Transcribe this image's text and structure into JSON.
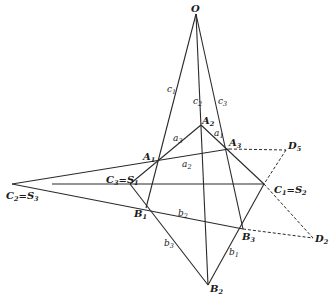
{
  "title": "",
  "points": {
    "O": {
      "label": "O",
      "sub": "",
      "x": 196,
      "y": 14
    },
    "A1": {
      "label": "A",
      "sub": "1",
      "x": 157,
      "y": 157
    },
    "A2": {
      "label": "A",
      "sub": "2",
      "x": 201,
      "y": 125
    },
    "A3": {
      "label": "A",
      "sub": "3",
      "x": 229,
      "y": 149
    },
    "B1": {
      "label": "B",
      "sub": "1",
      "x": 146,
      "y": 208
    },
    "B2": {
      "label": "B",
      "sub": "2",
      "x": 208,
      "y": 285
    },
    "B3": {
      "label": "B",
      "sub": "3",
      "x": 243,
      "y": 229
    },
    "C1S2": {
      "label": "C",
      "sub": "1",
      "eq": "=S",
      "eqsub": "2",
      "x": 264,
      "y": 184
    },
    "C2S3": {
      "label": "C",
      "sub": "2",
      "eq": "=S",
      "eqsub": "3",
      "x": 12,
      "y": 184
    },
    "C3S1": {
      "label": "C",
      "sub": "3",
      "eq": "=S",
      "eqsub": "1",
      "x": 130,
      "y": 184
    },
    "D5": {
      "label": "D",
      "sub": "5",
      "x": 286,
      "y": 150
    },
    "D2": {
      "label": "D",
      "sub": "2",
      "x": 313,
      "y": 238
    }
  },
  "edge_labels": {
    "c1": {
      "label": "c",
      "sub": "1"
    },
    "c2": {
      "label": "c",
      "sub": "2"
    },
    "c3": {
      "label": "c",
      "sub": "3"
    },
    "a1": {
      "label": "a",
      "sub": "1"
    },
    "a2": {
      "label": "a",
      "sub": "2"
    },
    "a3": {
      "label": "a",
      "sub": "3"
    },
    "b1": {
      "label": "b",
      "sub": "1"
    },
    "b2": {
      "label": "b",
      "sub": "2"
    },
    "b3": {
      "label": "b",
      "sub": "3"
    }
  },
  "colors": {
    "line": "#2a2a2a",
    "background": "#ffffff"
  }
}
